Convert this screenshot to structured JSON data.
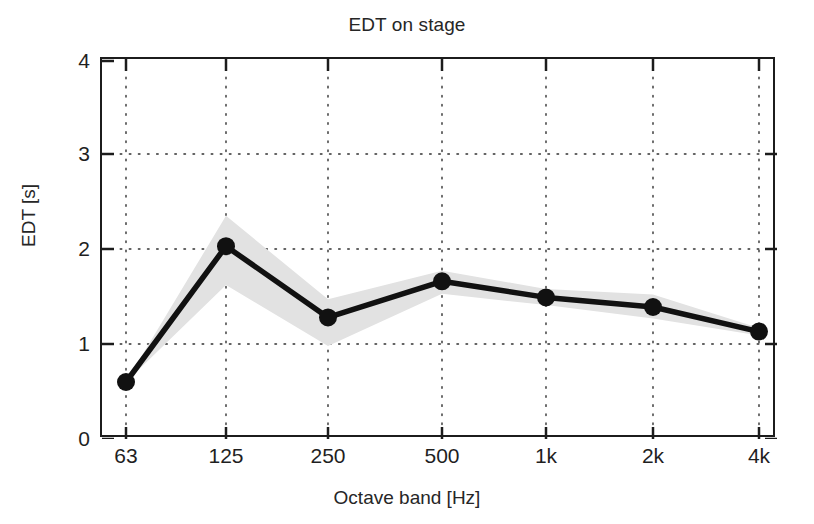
{
  "chart_data": {
    "type": "line",
    "title": "EDT on stage",
    "xlabel": "Octave band [Hz]",
    "ylabel": "EDT [s]",
    "categories": [
      "63",
      "125",
      "250",
      "500",
      "1k",
      "2k",
      "4k"
    ],
    "values": [
      0.6,
      2.03,
      1.28,
      1.66,
      1.49,
      1.39,
      1.13
    ],
    "band_upper": [
      0.6,
      2.35,
      1.47,
      1.77,
      1.58,
      1.52,
      1.17
    ],
    "band_lower": [
      0.6,
      1.62,
      0.98,
      1.53,
      1.41,
      1.27,
      1.09
    ],
    "series": [
      {
        "name": "EDT",
        "values": [
          0.6,
          2.03,
          1.28,
          1.66,
          1.49,
          1.39,
          1.13
        ]
      }
    ],
    "ylim": [
      0,
      4
    ],
    "yticks": [
      "0",
      "1",
      "2",
      "3",
      "4"
    ],
    "ytick_values": [
      0,
      1,
      2,
      3,
      4
    ],
    "xticks": [
      "63",
      "125",
      "250",
      "500",
      "1k",
      "2k",
      "4k"
    ],
    "grid": "dotted",
    "legend": "none",
    "line_color": "#111111",
    "band_color": "#e2e2e2",
    "marker": "filled-circle"
  }
}
